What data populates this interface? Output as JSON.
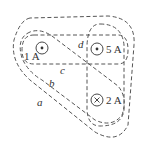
{
  "diagram": {
    "type": "ampere-loops",
    "currents": [
      {
        "id": "i1",
        "label": "1 A",
        "direction": "out-of-page",
        "symbol": "dot"
      },
      {
        "id": "i2",
        "label": "5 A",
        "direction": "out-of-page",
        "symbol": "dot"
      },
      {
        "id": "i3",
        "label": "2 A",
        "direction": "into-page",
        "symbol": "cross"
      }
    ],
    "loops": [
      {
        "id": "a",
        "label": "a",
        "encloses": [
          "1 A",
          "5 A",
          "2 A"
        ]
      },
      {
        "id": "b",
        "label": "b",
        "encloses": [
          "1 A",
          "2 A"
        ]
      },
      {
        "id": "c",
        "label": "c",
        "encloses": [
          "1 A",
          "5 A"
        ]
      },
      {
        "id": "d",
        "label": "d",
        "encloses": [
          "5 A",
          "2 A"
        ]
      }
    ],
    "colors": {
      "line": "#555555",
      "text": "#333333",
      "background": "#ffffff"
    }
  }
}
